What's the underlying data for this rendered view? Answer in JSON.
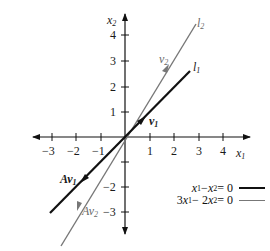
{
  "figure": {
    "x_axis": {
      "label": "x",
      "label_sub": "1",
      "ticks": [
        "−3",
        "−2",
        "−1",
        "1",
        "2",
        "3",
        "4"
      ]
    },
    "y_axis": {
      "label": "x",
      "label_sub": "2",
      "ticks": [
        "4",
        "3",
        "2",
        "1",
        "−2",
        "−3"
      ]
    },
    "lines": [
      {
        "id": "l1",
        "label": "l",
        "label_sub": "1",
        "equation": "x₁ − x₂ = 0",
        "color": "#111111",
        "style": "thick"
      },
      {
        "id": "l2",
        "label": "l",
        "label_sub": "2",
        "equation": "3x₁ − 2x₂ = 0",
        "color": "#777777",
        "style": "thin"
      }
    ],
    "vectors": [
      {
        "label": "v",
        "sub": "1",
        "prefix": ""
      },
      {
        "label": "v",
        "sub": "2",
        "prefix": ""
      },
      {
        "label": "v",
        "sub": "1",
        "prefix": "A"
      },
      {
        "label": "v",
        "sub": "2",
        "prefix": "A"
      }
    ],
    "legend": [
      {
        "text_a": "x",
        "sub_a": "1",
        "mid": " − ",
        "text_b": "x",
        "sub_b": "2",
        "tail": " = 0",
        "lead": ""
      },
      {
        "lead": "3",
        "text_a": "x",
        "sub_a": "1",
        "mid": " − 2",
        "text_b": "x",
        "sub_b": "2",
        "tail": " = 0"
      }
    ]
  }
}
